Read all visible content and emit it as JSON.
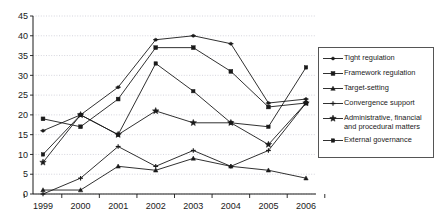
{
  "chart_data": {
    "type": "line",
    "title": "",
    "xlabel": "",
    "ylabel": "",
    "categories": [
      "1999",
      "2000",
      "2001",
      "2002",
      "2003",
      "2004",
      "2005",
      "2006"
    ],
    "ylim": [
      0,
      45
    ],
    "ytick_step": 5,
    "yticks": [
      0,
      5,
      10,
      15,
      20,
      25,
      30,
      35,
      40,
      45
    ],
    "grid": true,
    "legend_position": "right",
    "series": [
      {
        "name": "Tight regulation",
        "marker": "plus-dot",
        "values": [
          16,
          20,
          27,
          39,
          40,
          38,
          23,
          24
        ]
      },
      {
        "name": "Framework regulation",
        "marker": "square",
        "values": [
          19,
          17,
          24,
          37,
          37,
          31,
          22,
          23
        ]
      },
      {
        "name": "Target-setting",
        "marker": "triangle",
        "values": [
          1,
          1,
          7,
          6,
          9,
          7,
          6,
          4
        ]
      },
      {
        "name": "Convergence support",
        "marker": "cross",
        "values": [
          0,
          4,
          12,
          7,
          11,
          7,
          11,
          23
        ]
      },
      {
        "name": "Administrative, financial\nand procedural matters",
        "marker": "star",
        "values": [
          8,
          20,
          15,
          21,
          18,
          18,
          12.5,
          23
        ]
      },
      {
        "name": "External governance",
        "marker": "dot",
        "values": [
          10,
          20,
          15,
          33,
          26,
          18,
          17,
          32
        ]
      }
    ]
  },
  "legend": {
    "items": [
      {
        "label": "Tight regulation"
      },
      {
        "label": "Framework regulation"
      },
      {
        "label": "Target-setting"
      },
      {
        "label": "Convergence support"
      },
      {
        "label": "Administrative, financial\nand procedural matters"
      },
      {
        "label": "External governance"
      }
    ]
  },
  "colors": {
    "line": "#1a1a1a",
    "grid": "#b9b9c6",
    "axis": "#1a1a1a",
    "background": "#ffffff",
    "legend_border": "#555555"
  }
}
